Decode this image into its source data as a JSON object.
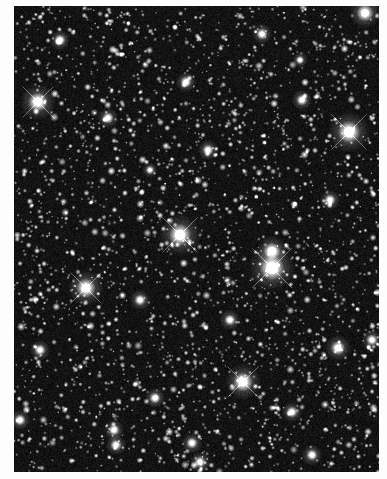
{
  "image": {
    "subject": "Dense astronomical star field (grayscale)",
    "width": 387,
    "height": 479,
    "border_color": "#fdfdfd",
    "field": {
      "x": 14,
      "y": 6,
      "width": 365,
      "height": 466
    },
    "background_color": "#0a0a0a",
    "star_color": "#ffffff",
    "faint_star_count": 2600,
    "bright_stars": [
      {
        "x": 272,
        "y": 268,
        "r": 9,
        "spikes": true
      },
      {
        "x": 272,
        "y": 251,
        "r": 6,
        "spikes": false
      },
      {
        "x": 180,
        "y": 235,
        "r": 8,
        "spikes": true
      },
      {
        "x": 349,
        "y": 132,
        "r": 8,
        "spikes": true
      },
      {
        "x": 86,
        "y": 288,
        "r": 7,
        "spikes": true
      },
      {
        "x": 243,
        "y": 382,
        "r": 7,
        "spikes": true
      },
      {
        "x": 38,
        "y": 102,
        "r": 7,
        "spikes": true
      },
      {
        "x": 365,
        "y": 13,
        "r": 6,
        "spikes": false
      },
      {
        "x": 262,
        "y": 34,
        "r": 4,
        "spikes": false
      },
      {
        "x": 186,
        "y": 82,
        "r": 4,
        "spikes": false
      },
      {
        "x": 208,
        "y": 150,
        "r": 4,
        "spikes": false
      },
      {
        "x": 108,
        "y": 118,
        "r": 4,
        "spikes": false
      },
      {
        "x": 338,
        "y": 348,
        "r": 5,
        "spikes": false
      },
      {
        "x": 372,
        "y": 340,
        "r": 4,
        "spikes": false
      },
      {
        "x": 292,
        "y": 412,
        "r": 4,
        "spikes": false
      },
      {
        "x": 312,
        "y": 455,
        "r": 4,
        "spikes": false
      },
      {
        "x": 114,
        "y": 430,
        "r": 4,
        "spikes": false
      },
      {
        "x": 116,
        "y": 445,
        "r": 4,
        "spikes": false
      },
      {
        "x": 155,
        "y": 398,
        "r": 4,
        "spikes": false
      },
      {
        "x": 192,
        "y": 443,
        "r": 4,
        "spikes": false
      },
      {
        "x": 200,
        "y": 462,
        "r": 4,
        "spikes": false
      },
      {
        "x": 40,
        "y": 350,
        "r": 4,
        "spikes": false
      },
      {
        "x": 20,
        "y": 420,
        "r": 4,
        "spikes": false
      },
      {
        "x": 302,
        "y": 100,
        "r": 4,
        "spikes": false
      },
      {
        "x": 330,
        "y": 200,
        "r": 4,
        "spikes": false
      },
      {
        "x": 60,
        "y": 40,
        "r": 4,
        "spikes": false
      },
      {
        "x": 140,
        "y": 300,
        "r": 4,
        "spikes": false
      },
      {
        "x": 230,
        "y": 320,
        "r": 4,
        "spikes": false
      },
      {
        "x": 300,
        "y": 60,
        "r": 3,
        "spikes": false
      },
      {
        "x": 150,
        "y": 170,
        "r": 3,
        "spikes": false
      }
    ],
    "seed": 20240611
  }
}
